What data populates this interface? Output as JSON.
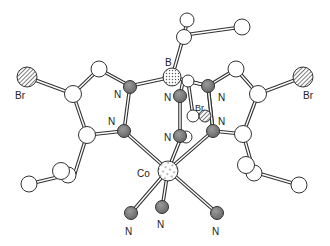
{
  "diagram": {
    "type": "ball-and-stick molecular structure",
    "colors": {
      "carbon": "#ffffff",
      "nitrogen": "#7a7a7a",
      "stroke": "#333333",
      "background": "#ffffff"
    },
    "labels": {
      "boron": "B",
      "cobalt": "Co",
      "br_left": "Br",
      "br_right": "Br",
      "br_center": "Br",
      "n_left_upper": "N",
      "n_left_lower": "N",
      "n_right_upper": "N",
      "n_right_lower": "N",
      "n_center_upper": "N",
      "n_center_lower": "N",
      "n_bottom_left": "N",
      "n_bottom_center": "N",
      "n_bottom_right": "N"
    }
  }
}
